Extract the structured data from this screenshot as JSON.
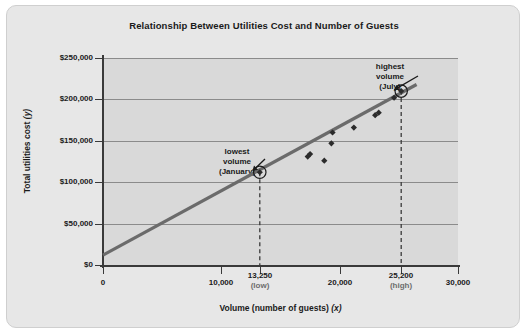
{
  "chart_data": {
    "type": "scatter",
    "title": "Relationship Between Utilities Cost and Number of Guests",
    "xlabel": "Volume (number of guests)",
    "xlabel_var": "(x)",
    "ylabel": "Total utilities cost",
    "ylabel_var": "(y)",
    "xlim": [
      0,
      30000
    ],
    "ylim": [
      0,
      250000
    ],
    "grid": true,
    "legend": "none",
    "y_ticks": [
      {
        "value": 0,
        "label": "$0"
      },
      {
        "value": 50000,
        "label": "$50,000"
      },
      {
        "value": 100000,
        "label": "$100,000"
      },
      {
        "value": 150000,
        "label": "$150,000"
      },
      {
        "value": 200000,
        "label": "$200,000"
      },
      {
        "value": 250000,
        "label": "$250,000"
      }
    ],
    "x_ticks": [
      {
        "value": 0,
        "label": "0",
        "sublabel": ""
      },
      {
        "value": 10000,
        "label": "10,000",
        "sublabel": ""
      },
      {
        "value": 13250,
        "label": "13,250",
        "sublabel": "(low)"
      },
      {
        "value": 20000,
        "label": "20,000",
        "sublabel": ""
      },
      {
        "value": 25200,
        "label": "25,200",
        "sublabel": "(high)"
      },
      {
        "value": 30000,
        "label": "30,000",
        "sublabel": ""
      }
    ],
    "points": [
      {
        "x": 13250,
        "y": 112000,
        "highlight": true,
        "note": "lowest volume (January)"
      },
      {
        "x": 17300,
        "y": 131000,
        "highlight": false
      },
      {
        "x": 17500,
        "y": 134000,
        "highlight": false
      },
      {
        "x": 18700,
        "y": 126000,
        "highlight": false
      },
      {
        "x": 19300,
        "y": 147000,
        "highlight": false
      },
      {
        "x": 19400,
        "y": 160000,
        "highlight": false
      },
      {
        "x": 21200,
        "y": 166000,
        "highlight": false
      },
      {
        "x": 23000,
        "y": 181000,
        "highlight": false
      },
      {
        "x": 23300,
        "y": 184000,
        "highlight": false
      },
      {
        "x": 24600,
        "y": 202000,
        "highlight": false
      },
      {
        "x": 25200,
        "y": 210000,
        "highlight": true,
        "note": "highest volume (July)"
      }
    ],
    "trend_line": {
      "x_start": 0,
      "y_start": 12000,
      "x_end": 26500,
      "y_end": 218000,
      "color": "#6b6b6b",
      "width": 3.2
    },
    "marker_color": "#2b2b2b",
    "marker_shape": "diamond",
    "plot_bg": "#d9d9d9",
    "card_bg": "#e7e7e7",
    "drop_lines": [
      {
        "x": 13250,
        "y": 112000,
        "style": "dashed"
      },
      {
        "x": 25200,
        "y": 210000,
        "style": "dashed"
      }
    ],
    "annotations": [
      {
        "id": "lowest",
        "line1": "lowest",
        "line2": "volume",
        "line3": "(January)",
        "target_x": 13250,
        "target_y": 112000
      },
      {
        "id": "highest",
        "line1": "highest",
        "line2": "volume",
        "line3": "(July)",
        "target_x": 25200,
        "target_y": 210000
      }
    ]
  }
}
